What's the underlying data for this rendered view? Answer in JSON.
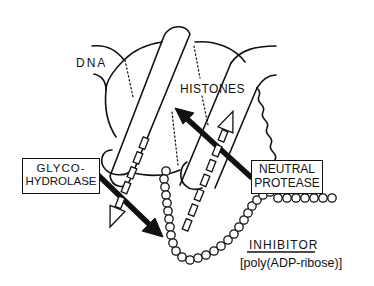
{
  "diagram": {
    "labels": {
      "dna": "DNA",
      "histones": "HISTONES",
      "glycohydrolase": {
        "line1": "GLYCO-",
        "line2": "HYDROLASE"
      },
      "neutral_protease": {
        "line1": "NEUTRAL",
        "line2": "PROTEASE"
      },
      "inhibitor": "INHIBITOR",
      "inhibitor_detail": "[poly(ADP-ribose)]"
    },
    "colors": {
      "ink": "#111111",
      "background": "#ffffff"
    },
    "elements": [
      {
        "id": "dna-strand",
        "kind": "curve"
      },
      {
        "id": "histone-core",
        "kind": "rounded-cylinder"
      },
      {
        "id": "inhibitor-chain",
        "kind": "bead-chain"
      },
      {
        "id": "glycohydrolase-arrow",
        "kind": "solid-arrow",
        "from": "glycohydrolase",
        "to": "inhibitor-chain"
      },
      {
        "id": "neutral-protease-arrow",
        "kind": "solid-arrow",
        "from": "neutral-protease",
        "to": "histones"
      },
      {
        "id": "release-arrow-left",
        "kind": "dashed-hollow-arrow",
        "direction": "down"
      },
      {
        "id": "release-arrow-right",
        "kind": "dashed-hollow-arrow",
        "direction": "up"
      }
    ]
  }
}
